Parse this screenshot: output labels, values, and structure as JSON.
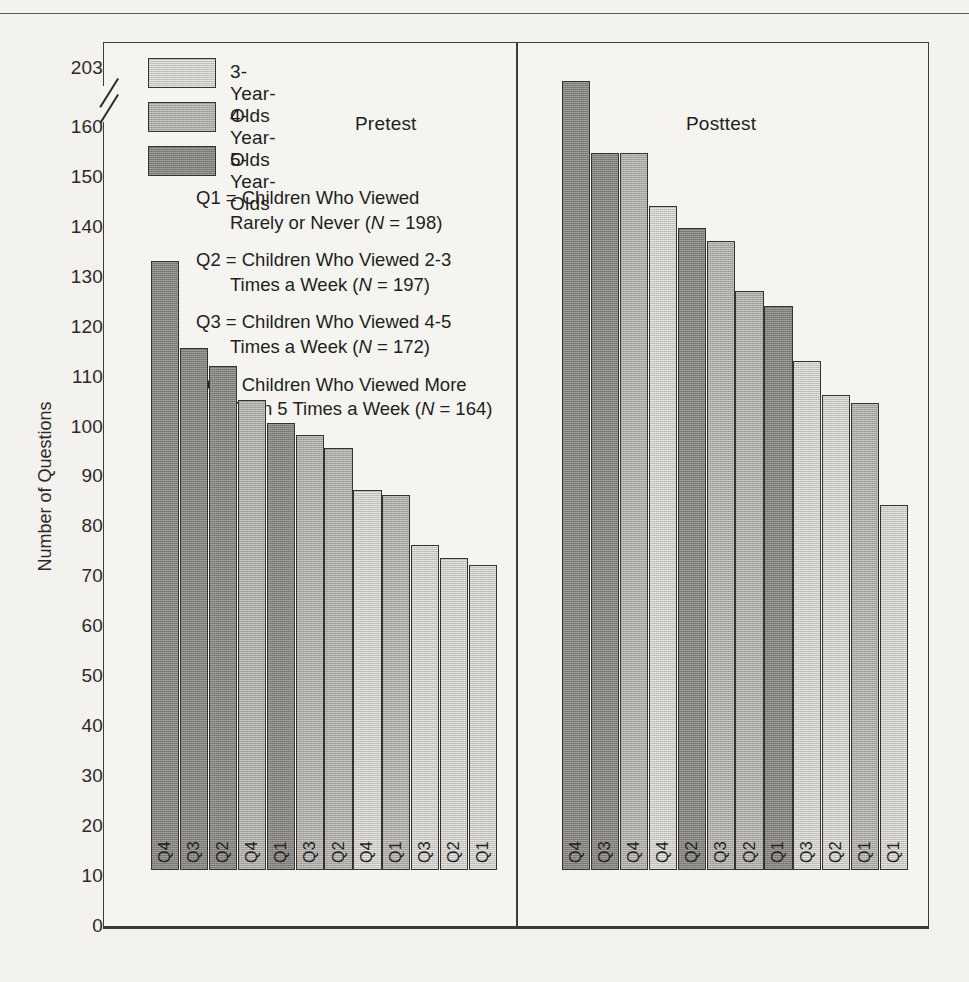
{
  "axis": {
    "y_title": "Number of Questions",
    "ticks": [
      "203",
      "160",
      "150",
      "140",
      "130",
      "120",
      "110",
      "100",
      "90",
      "80",
      "70",
      "60",
      "50",
      "40",
      "30",
      "20",
      "10",
      "0"
    ],
    "break_between": [
      "160",
      "203"
    ]
  },
  "legend": {
    "items": [
      {
        "label": "3-Year-Olds",
        "tone": "tone-3",
        "color": "#c7c5bf"
      },
      {
        "label": "4-Year-Olds",
        "tone": "tone-4",
        "color": "#a9a7a1"
      },
      {
        "label": "5-Year-Olds",
        "tone": "tone-5",
        "color": "#82807b"
      }
    ]
  },
  "captions": {
    "pretest": "Pretest",
    "posttest": "Posttest"
  },
  "qdefs": [
    {
      "l1": "Q1 = Children Who Viewed",
      "l2_pre": "Rarely or Never (",
      "l2_it": "N",
      "l2_post": " = 198)"
    },
    {
      "l1": "Q2 = Children Who Viewed 2-3",
      "l2_pre": "Times a Week (",
      "l2_it": "N",
      "l2_post": " = 197)"
    },
    {
      "l1": "Q3 = Children Who Viewed 4-5",
      "l2_pre": "Times a Week (",
      "l2_it": "N",
      "l2_post": " = 172)"
    },
    {
      "l1": "Q4 = Children Who Viewed More",
      "l2_pre": "Than 5 Times a Week (",
      "l2_it": "N",
      "l2_post": " = 164)"
    }
  ],
  "chart_data": {
    "type": "bar",
    "title": "",
    "xlabel": "",
    "ylabel": "Number of Questions",
    "ylim": [
      0,
      160
    ],
    "y_axis_break": true,
    "y_axis_break_top_tick": 203,
    "yticks": [
      0,
      10,
      20,
      30,
      40,
      50,
      60,
      70,
      80,
      90,
      100,
      110,
      120,
      130,
      140,
      150,
      160,
      203
    ],
    "grid": false,
    "legend_position": "top-left",
    "legend_entries": [
      "3-Year-Olds",
      "4-Year-Olds",
      "5-Year-Olds"
    ],
    "panels": [
      {
        "name": "Pretest",
        "bars": [
          {
            "question": "Q4",
            "age_group": "5-Year-Olds",
            "tone": "tone-5",
            "value": 122
          },
          {
            "question": "Q3",
            "age_group": "5-Year-Olds",
            "tone": "tone-5",
            "value": 104.5
          },
          {
            "question": "Q2",
            "age_group": "5-Year-Olds",
            "tone": "tone-5",
            "value": 101
          },
          {
            "question": "Q4",
            "age_group": "4-Year-Olds",
            "tone": "tone-4",
            "value": 94
          },
          {
            "question": "Q1",
            "age_group": "5-Year-Olds",
            "tone": "tone-5",
            "value": 89.5
          },
          {
            "question": "Q3",
            "age_group": "4-Year-Olds",
            "tone": "tone-4",
            "value": 87
          },
          {
            "question": "Q2",
            "age_group": "4-Year-Olds",
            "tone": "tone-4",
            "value": 84.5
          },
          {
            "question": "Q4",
            "age_group": "3-Year-Olds",
            "tone": "tone-3",
            "value": 76
          },
          {
            "question": "Q1",
            "age_group": "4-Year-Olds",
            "tone": "tone-4",
            "value": 75
          },
          {
            "question": "Q3",
            "age_group": "3-Year-Olds",
            "tone": "tone-3",
            "value": 65
          },
          {
            "question": "Q2",
            "age_group": "3-Year-Olds",
            "tone": "tone-3",
            "value": 62.5
          },
          {
            "question": "Q1",
            "age_group": "3-Year-Olds",
            "tone": "tone-3",
            "value": 61
          }
        ]
      },
      {
        "name": "Posttest",
        "bars": [
          {
            "question": "Q4",
            "age_group": "5-Year-Olds",
            "tone": "tone-5",
            "value": 158
          },
          {
            "question": "Q3",
            "age_group": "5-Year-Olds",
            "tone": "tone-5",
            "value": 143.5
          },
          {
            "question": "Q4",
            "age_group": "4-Year-Olds",
            "tone": "tone-4",
            "value": 143.5
          },
          {
            "question": "Q4",
            "age_group": "3-Year-Olds",
            "tone": "tone-3",
            "value": 133
          },
          {
            "question": "Q2",
            "age_group": "5-Year-Olds",
            "tone": "tone-5",
            "value": 128.5
          },
          {
            "question": "Q3",
            "age_group": "4-Year-Olds",
            "tone": "tone-4",
            "value": 126
          },
          {
            "question": "Q2",
            "age_group": "4-Year-Olds",
            "tone": "tone-4",
            "value": 116
          },
          {
            "question": "Q1",
            "age_group": "5-Year-Olds",
            "tone": "tone-5",
            "value": 113
          },
          {
            "question": "Q3",
            "age_group": "3-Year-Olds",
            "tone": "tone-3",
            "value": 102
          },
          {
            "question": "Q2",
            "age_group": "3-Year-Olds",
            "tone": "tone-3",
            "value": 95
          },
          {
            "question": "Q1",
            "age_group": "4-Year-Olds",
            "tone": "tone-4",
            "value": 93.5
          },
          {
            "question": "Q1",
            "age_group": "3-Year-Olds",
            "tone": "tone-3",
            "value": 73
          }
        ]
      }
    ]
  }
}
